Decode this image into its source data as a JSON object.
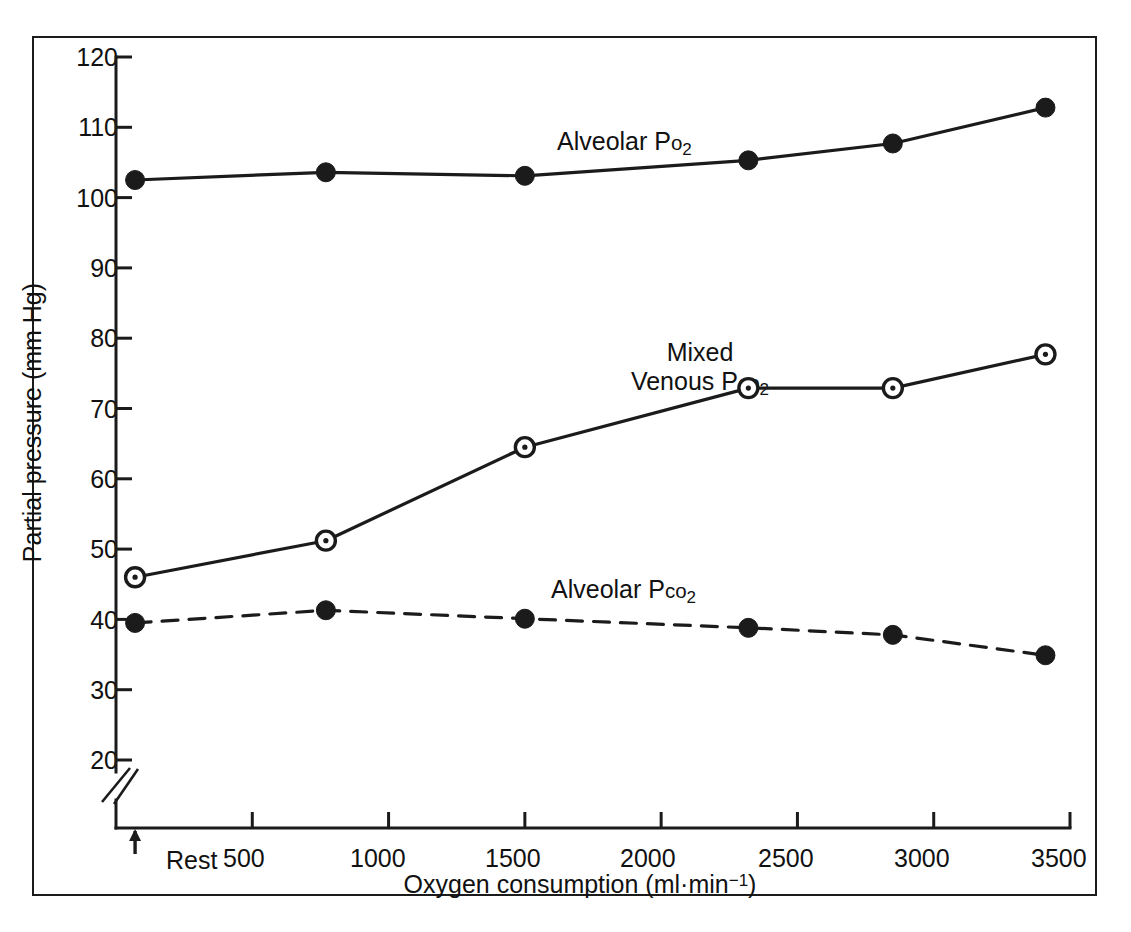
{
  "figure": {
    "background": "#ffffff",
    "ink_color": "#1b1b1b",
    "border": "thin black rectangle frame"
  },
  "axes": {
    "y_title": "Partial pressure  (mm Hg)",
    "x_title_plain": "Oxygen consumption (ml · min-1)",
    "x_title_prefix": "Oxygen consumption (ml",
    "x_title_middot": "·",
    "x_title_unit": "min",
    "x_title_exponent": "−1",
    "x_title_suffix": ")",
    "y_ticks": [
      120,
      110,
      100,
      90,
      80,
      70,
      60,
      50,
      40,
      30,
      20
    ],
    "y_tick_labels": [
      "120",
      "110",
      "100",
      "90",
      "80",
      "70",
      "60",
      "50",
      "40",
      "30",
      "20"
    ],
    "x_ticks": [
      500,
      1000,
      1500,
      2000,
      2500,
      3000,
      3500
    ],
    "x_tick_labels": [
      "500",
      "1000",
      "1500",
      "2000",
      "2500",
      "3000",
      "3500"
    ],
    "rest_label": "Rest",
    "axis_break": "double-slash break on y-axis below 20",
    "ylim": [
      20,
      120
    ],
    "xlim": [
      0,
      3500
    ],
    "grid": "off"
  },
  "series_labels": {
    "alveolar_po2": {
      "text_main": "Alveolar P",
      "text_sub1": "o",
      "text_sub2": "2"
    },
    "mixed_venous_pco2_line1": "Mixed",
    "mixed_venous_pco2_line2_main": "Venous P",
    "mixed_venous_pco2_line2_sub": "co",
    "mixed_venous_pco2_line2_num": "2",
    "alveolar_pco2": {
      "text_main": "Alveolar P",
      "text_sub1": "co",
      "text_sub2": "2"
    }
  },
  "chart_data": {
    "type": "line",
    "title": "",
    "xlabel": "Oxygen consumption (ml·min⁻¹)",
    "ylabel": "Partial pressure  (mm Hg)",
    "xlim": [
      0,
      3500
    ],
    "ylim": [
      20,
      120
    ],
    "grid": false,
    "legend": "inline annotations next to each curve",
    "x": [
      70,
      770,
      1500,
      2320,
      2850,
      3410
    ],
    "x_point_names": [
      "Rest",
      "770",
      "1500",
      "2320",
      "2850",
      "3410"
    ],
    "series": [
      {
        "name": "Alveolar Po2",
        "marker": "filled-circle",
        "linestyle": "solid",
        "values": [
          102.5,
          103.6,
          103.1,
          105.3,
          107.7,
          112.8
        ]
      },
      {
        "name": "Mixed Venous Pco2",
        "marker": "open-circle-with-dot",
        "linestyle": "solid",
        "values": [
          46.0,
          51.2,
          64.5,
          72.9,
          72.9,
          77.7
        ]
      },
      {
        "name": "Alveolar Pco2",
        "marker": "filled-circle",
        "linestyle": "dashed",
        "values": [
          39.5,
          41.3,
          40.1,
          38.8,
          37.8,
          34.9
        ]
      }
    ]
  }
}
